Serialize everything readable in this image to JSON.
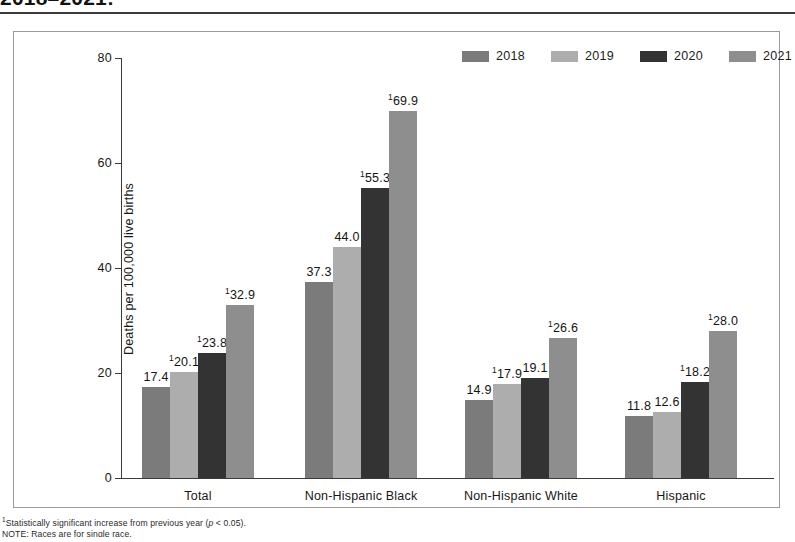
{
  "figure": {
    "title_partial": "2018–2021:",
    "y_axis_title": "Deaths per 100,000 live births",
    "footnote_1": "¹Statistically significant increase from previous year (p < 0.05).",
    "footnote_2": "NOTE: Races are for single race."
  },
  "legend": {
    "position": "top-right",
    "items": [
      {
        "label": "2018",
        "color": "#7b7b7b"
      },
      {
        "label": "2019",
        "color": "#adadad"
      },
      {
        "label": "2020",
        "color": "#333333"
      },
      {
        "label": "2021",
        "color": "#8e8e8e"
      }
    ]
  },
  "chart_data": {
    "type": "bar",
    "title": "2018–2021:",
    "xlabel": "",
    "ylabel": "Deaths per 100,000 live births",
    "ylim": [
      0,
      80
    ],
    "yticks": [
      0,
      20,
      40,
      60,
      80
    ],
    "ytick_labels": [
      "0",
      "20",
      "40",
      "60",
      "80"
    ],
    "grid": false,
    "legend_position": "top-right",
    "categories": [
      "Total",
      "Non-Hispanic Black",
      "Non-Hispanic White",
      "Hispanic"
    ],
    "series": [
      {
        "name": "2018",
        "color": "#7b7b7b",
        "values": [
          17.4,
          37.3,
          14.9,
          11.8
        ],
        "labels": [
          "17.4",
          "37.3",
          "14.9",
          "11.8"
        ],
        "significant": [
          false,
          false,
          false,
          false
        ]
      },
      {
        "name": "2019",
        "color": "#adadad",
        "values": [
          20.1,
          44.0,
          17.9,
          12.6
        ],
        "labels": [
          "20.1",
          "44.0",
          "17.9",
          "12.6"
        ],
        "significant": [
          true,
          false,
          true,
          false
        ]
      },
      {
        "name": "2020",
        "color": "#333333",
        "values": [
          23.8,
          55.3,
          19.1,
          18.2
        ],
        "labels": [
          "23.8",
          "55.3",
          "19.1",
          "18.2"
        ],
        "significant": [
          true,
          true,
          false,
          true
        ]
      },
      {
        "name": "2021",
        "color": "#8e8e8e",
        "values": [
          32.9,
          69.9,
          26.6,
          28.0
        ],
        "labels": [
          "32.9",
          "69.9",
          "26.6",
          "28.0"
        ],
        "significant": [
          true,
          true,
          true,
          true
        ]
      }
    ],
    "annotations": [
      "¹Statistically significant increase from previous year (p < 0.05)."
    ]
  }
}
